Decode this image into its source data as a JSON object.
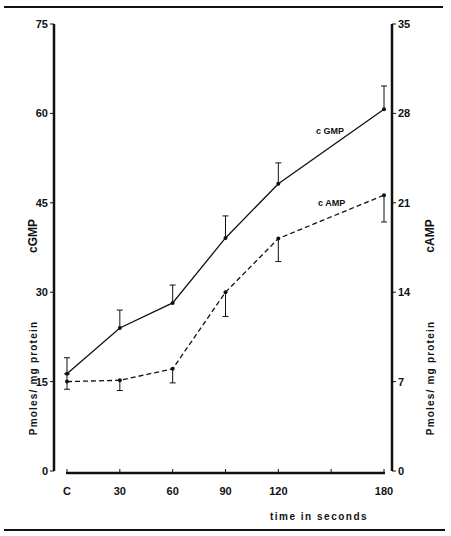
{
  "chart_data": {
    "type": "line",
    "title": "",
    "xlabel": "time in seconds",
    "categories": [
      "C",
      "30",
      "60",
      "90",
      "120",
      "180"
    ],
    "x": [
      0,
      30,
      60,
      90,
      120,
      180
    ],
    "x_ticks": [
      0,
      30,
      60,
      90,
      120,
      150,
      180
    ],
    "x_tick_labels": [
      "C",
      "30",
      "60",
      "90",
      "120",
      "",
      "180"
    ],
    "y_left": {
      "label": "cGMP",
      "sublabel": "Pmoles/ mg   protein",
      "ticks": [
        0,
        15,
        30,
        45,
        60,
        75
      ],
      "ylim": [
        0,
        75
      ]
    },
    "y_right": {
      "label": "cAMP",
      "sublabel": "Pmoles/ mg   protein",
      "ticks": [
        0,
        7,
        14,
        21,
        28,
        35
      ],
      "ylim": [
        0,
        35
      ]
    },
    "series": [
      {
        "name": "cGMP",
        "label_text": "c GMP",
        "axis": "left",
        "line_style": "solid",
        "values": [
          16.3,
          24.0,
          28.2,
          39.1,
          48.2,
          60.7
        ],
        "error": [
          2.7,
          3.0,
          3.0,
          3.7,
          3.5,
          3.9
        ],
        "error_direction": "up"
      },
      {
        "name": "cAMP",
        "label_text": "c AMP",
        "axis": "right",
        "line_style": "dashed",
        "values": [
          7.0,
          7.1,
          8.0,
          14.0,
          18.2,
          21.6
        ],
        "error": [
          0.6,
          0.8,
          1.1,
          1.9,
          1.8,
          2.1
        ],
        "error_direction": "down"
      }
    ],
    "grid": false,
    "legend": "inline labels near line ends"
  }
}
